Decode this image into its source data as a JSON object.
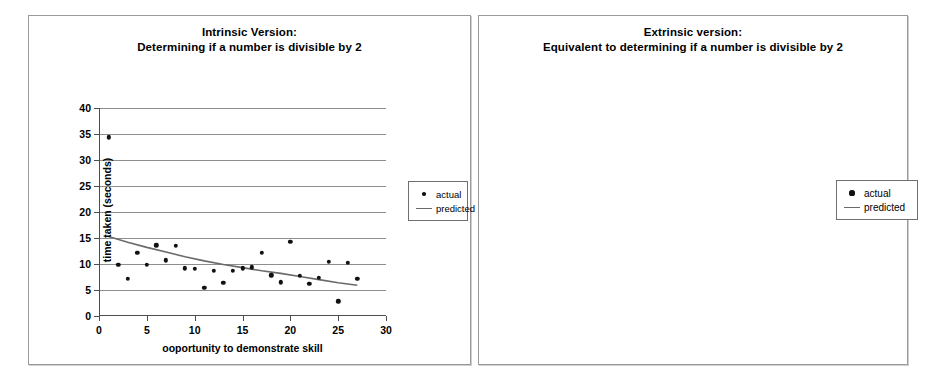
{
  "figure": {
    "background": "#ffffff",
    "marker_color": "#111111",
    "trend_color": "#6a6a6a",
    "grid_color": "#8e8e8e",
    "axis_color": "#4d4d4d",
    "panel_border": "#9a9a9a"
  },
  "charts": [
    {
      "id": "intrinsic",
      "title_line1": "Intrinsic Version:",
      "title_line2": "Determining if a number is divisible by 2",
      "legend": {
        "actual": "actual",
        "predicted": "predicted"
      }
    },
    {
      "id": "extrinsic",
      "title_line1": "Extrinsic version:",
      "title_line2": "Equivalent to determining if a number is divisible by 2",
      "legend": {
        "actual": "actual",
        "predicted": "predicted"
      }
    }
  ],
  "chart_data": [
    {
      "type": "scatter",
      "id": "intrinsic",
      "title": "Intrinsic Version: Determining if a number is divisible by 2",
      "xlabel": "ooportunity to demonstrate skill",
      "ylabel": "time taken (seconds)",
      "xlim": [
        0,
        30
      ],
      "ylim": [
        0,
        40
      ],
      "xticks": [
        0,
        5,
        10,
        15,
        20,
        25,
        30
      ],
      "xticklabels": [
        "0",
        "5",
        "10",
        "15",
        "20",
        "25",
        "30"
      ],
      "yticks": [
        0,
        5,
        10,
        15,
        20,
        25,
        30,
        35,
        40
      ],
      "yticklabels": [
        "0",
        "5",
        "10",
        "15",
        "20",
        "25",
        "30",
        "35",
        "40"
      ],
      "grid": "horizontal",
      "legend_position": "right-outside",
      "series": [
        {
          "name": "actual",
          "marker": "filled-circle",
          "x": [
            1,
            2,
            3,
            4,
            5,
            6,
            7,
            8,
            9,
            10,
            11,
            12,
            13,
            14,
            15,
            16,
            17,
            18,
            19,
            20,
            21,
            22,
            23,
            24,
            25,
            26,
            27
          ],
          "y": [
            34.4,
            9.9,
            7.1,
            12.2,
            9.8,
            13.6,
            10.7,
            13.5,
            9.2,
            9.1,
            5.4,
            8.7,
            6.4,
            8.7,
            9.2,
            9.4,
            12.1,
            7.8,
            6.5,
            14.3,
            7.7,
            6.2,
            7.4,
            10.4,
            2.8,
            10.2,
            7.2
          ]
        },
        {
          "name": "predicted",
          "marker": "line",
          "x": [
            1,
            3,
            5,
            7,
            9,
            11,
            13,
            15,
            17,
            19,
            21,
            23,
            25,
            27
          ],
          "y": [
            15.3,
            14.2,
            13.2,
            12.3,
            11.4,
            10.6,
            9.9,
            9.3,
            8.7,
            8.2,
            7.6,
            7.0,
            6.4,
            5.9
          ]
        }
      ]
    },
    {
      "type": "scatter",
      "id": "extrinsic",
      "title": "Extrinsic version: Equivalent to determining if a number is divisible by 2",
      "xlabel": "opportunity to demonstrate skill",
      "ylabel": "time",
      "xlim": [
        0,
        30
      ],
      "ylim": [
        0,
        40
      ],
      "xticks": [
        0,
        5,
        10,
        15,
        20,
        25,
        30
      ],
      "xticklabels": [
        "0",
        "5",
        "10",
        "15",
        "20",
        "25",
        "30"
      ],
      "yticks": [
        0,
        5,
        10,
        15,
        20,
        25,
        30,
        35,
        40
      ],
      "yticklabels": [
        "0",
        "5",
        "10",
        "15",
        "20",
        "25",
        "30",
        "35",
        "40"
      ],
      "grid": "horizontal",
      "legend_position": "right-outside",
      "series": [
        {
          "name": "actual",
          "marker": "filled-circle",
          "x": [
            1,
            2,
            3,
            4,
            5,
            6,
            7,
            8,
            9,
            10,
            11,
            12,
            13,
            14,
            15,
            16,
            17,
            18,
            19,
            20,
            21,
            22,
            23,
            24
          ],
          "y": [
            25.3,
            11.1,
            4.5,
            4.8,
            8.0,
            13.1,
            14.4,
            9.5,
            15.6,
            8.4,
            8.4,
            9.5,
            7.9,
            10.3,
            6.3,
            8.1,
            12.8,
            10.6,
            8.6,
            11.7,
            8.8,
            11.6,
            6.8,
            10.2
          ]
        },
        {
          "name": "predicted",
          "marker": "line",
          "x": [
            1,
            4,
            8,
            12,
            16,
            20,
            24
          ],
          "y": [
            11.8,
            11.2,
            10.6,
            10.1,
            9.6,
            9.1,
            8.7
          ]
        }
      ]
    }
  ]
}
